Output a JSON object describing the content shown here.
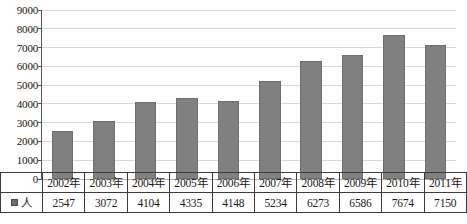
{
  "chart_data": {
    "type": "bar",
    "title": "",
    "xlabel": "",
    "ylabel": "",
    "ylim": [
      0,
      9000
    ],
    "grid": true,
    "legend_position": "table-row-header",
    "categories": [
      "2002年",
      "2003年",
      "2004年",
      "2005年",
      "2006年",
      "2007年",
      "2008年",
      "2009年",
      "2010年",
      "2011年"
    ],
    "values": [
      2547,
      3072,
      4104,
      4335,
      4148,
      5234,
      6273,
      6586,
      7674,
      7150
    ],
    "series": [
      {
        "name": "人",
        "values": [
          2547,
          3072,
          4104,
          4335,
          4148,
          5234,
          6273,
          6586,
          7674,
          7150
        ],
        "color": "#808080"
      }
    ],
    "y_ticks": [
      9000,
      8000,
      7000,
      6000,
      5000,
      4000,
      3000,
      2000,
      1000,
      0
    ],
    "y_tick_labels": [
      "9000",
      "8000",
      "7000",
      "6000",
      "5000",
      "4000",
      "3000",
      "2000",
      "1000",
      "0"
    ]
  },
  "legend": {
    "marker": "square-swatch-icon",
    "label": "人",
    "color": "#6b6b6b"
  },
  "table": {
    "year_row": [
      "2002年",
      "2003年",
      "2004年",
      "2005年",
      "2006年",
      "2007年",
      "2008年",
      "2009年",
      "2010年",
      "2011年"
    ],
    "value_row": [
      "2547",
      "3072",
      "4104",
      "4335",
      "4148",
      "5234",
      "6273",
      "6586",
      "7674",
      "7150"
    ]
  },
  "colors": {
    "bar_fill": "#808080",
    "bar_stroke": "#6e6e6e",
    "gridline": "#d9d9d9",
    "axis": "#555555",
    "table_border": "#3d3d3d",
    "text": "#141414"
  }
}
